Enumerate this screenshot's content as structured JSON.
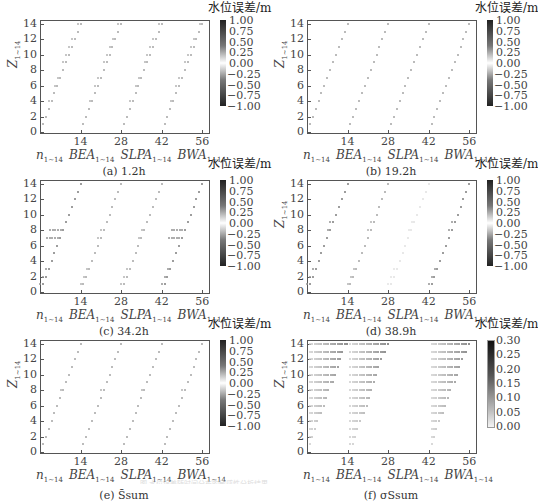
{
  "figure": {
    "colorbar_title": "水位误差/m",
    "ylabel_main": "Z",
    "ylabel_sub": "1~14",
    "xlabel_groups": [
      {
        "main": "n",
        "sub": "1~14"
      },
      {
        "main": "BEA",
        "sub": "1~14"
      },
      {
        "main": "SLPA",
        "sub": "1~14"
      },
      {
        "main": "BWA",
        "sub": "1~14"
      }
    ],
    "footer_text": "图 水位误差随时间分布的敏感性分析结果"
  },
  "panels": [
    {
      "id": "a",
      "caption": "(a) 1.2h",
      "show_ylabel": true
    },
    {
      "id": "b",
      "caption": "(b) 19.2h",
      "show_ylabel": true
    },
    {
      "id": "c",
      "caption": "(c) 34.2h",
      "show_ylabel": false
    },
    {
      "id": "d",
      "caption": "(d) 38.9h",
      "show_ylabel": true
    },
    {
      "id": "e",
      "caption": "(e) S̄sum",
      "show_ylabel": true
    },
    {
      "id": "f",
      "caption": "(f) σSsum",
      "show_ylabel": true
    }
  ],
  "chart_data": [
    {
      "type": "scatter",
      "title": "(a) 1.2h",
      "xlabel": "n1~14  BEA1~14  SLPA1~14  BWA1~14",
      "ylabel": "Z1~14",
      "xticks": [
        14,
        28,
        42,
        56
      ],
      "yticks": [
        0,
        2,
        4,
        6,
        8,
        10,
        12,
        14
      ],
      "xlim": [
        0,
        58
      ],
      "ylim": [
        0,
        14.5
      ],
      "colorbar": {
        "label": "水位误差/m",
        "ticks": [
          "1.00",
          "0.75",
          "0.50",
          "0.25",
          "0.00",
          "-0.25",
          "-0.50",
          "-0.75",
          "-1.00"
        ],
        "range": [
          -1.0,
          1.0
        ]
      },
      "description": "Diagonal bands of small markers for each parameter group; slight spreading at several levels in n, BEA and BWA groups; values near 0 with small mixed deviations",
      "spread_rows": [
        4,
        6,
        7,
        9,
        10,
        11,
        12,
        14
      ]
    },
    {
      "type": "scatter",
      "title": "(b) 19.2h",
      "xlabel": "n1~14  BEA1~14  SLPA1~14  BWA1~14",
      "ylabel": "Z1~14",
      "xticks": [
        14,
        28,
        42,
        56
      ],
      "yticks": [
        0,
        2,
        4,
        6,
        8,
        10,
        12,
        14
      ],
      "xlim": [
        0,
        58
      ],
      "ylim": [
        0,
        14.5
      ],
      "colorbar": {
        "label": "水位误差/m",
        "ticks": [
          "1.00",
          "0.75",
          "0.50",
          "0.25",
          "0.00",
          "-0.25",
          "-0.50",
          "-0.75",
          "-1.00"
        ],
        "range": [
          -1.0,
          1.0
        ]
      },
      "description": "Clean diagonal lines, single markers per row, errors near 0",
      "spread_rows": []
    },
    {
      "type": "scatter",
      "title": "(c) 34.2h",
      "xlabel": "n1~14  BEA1~14  SLPA1~14  BWA1~14",
      "ylabel": "",
      "xticks": [
        14,
        28,
        42,
        56
      ],
      "yticks": [
        0,
        2,
        4,
        6,
        8,
        10,
        12,
        14
      ],
      "xlim": [
        0,
        58
      ],
      "ylim": [
        0,
        14.5
      ],
      "colorbar": {
        "label": "水位误差/m",
        "ticks": [
          "1.00",
          "0.75",
          "0.50",
          "0.25",
          "0.00",
          "-0.25",
          "-0.50",
          "-0.75",
          "-1.00"
        ],
        "range": [
          -1.0,
          1.0
        ]
      },
      "description": "Strong horizontal spread at Z=7-8 in n group and BWA group; darker markers in lower BWA rows",
      "spread_rows": [
        1,
        2,
        3,
        7,
        8
      ]
    },
    {
      "type": "scatter",
      "title": "(d) 38.9h",
      "xlabel": "n1~14  BEA1~14  SLPA1~14  BWA1~14",
      "ylabel": "Z1~14",
      "xticks": [
        14,
        28,
        42,
        56
      ],
      "yticks": [
        0,
        2,
        4,
        6,
        8,
        10,
        12,
        14
      ],
      "xlim": [
        0,
        58
      ],
      "ylim": [
        0,
        14.5
      ],
      "colorbar": {
        "label": "水位误差/m",
        "ticks": [
          "1.00",
          "0.75",
          "0.50",
          "0.25",
          "0.00",
          "-0.25",
          "-0.50",
          "-0.75",
          "-1.00"
        ],
        "range": [
          -1.0,
          1.0
        ]
      },
      "description": "Darker markers in n and BWA groups; SLPA group very faint",
      "spread_rows": [
        1,
        2,
        3,
        8,
        9
      ]
    },
    {
      "type": "scatter",
      "title": "(e) S̄sum",
      "xlabel": "n1~14  BEA1~14  SLPA1~14  BWA1~14",
      "ylabel": "Z1~14",
      "xticks": [
        14,
        28,
        42,
        56
      ],
      "yticks": [
        0,
        2,
        4,
        6,
        8,
        10,
        12,
        14
      ],
      "xlim": [
        0,
        58
      ],
      "ylim": [
        0,
        14.5
      ],
      "colorbar": {
        "label": "水位误差/m",
        "ticks": [
          "1.00",
          "0.75",
          "0.50",
          "0.25",
          "0.00",
          "-0.25",
          "-0.50",
          "-0.75",
          "-1.00"
        ],
        "range": [
          -1.0,
          1.0
        ]
      },
      "description": "Mean error: clean diagonal lines with minor spread near Z=8",
      "spread_rows": [
        8
      ]
    },
    {
      "type": "scatter",
      "title": "(f) σSsum",
      "xlabel": "n1~14  BEA1~14  SLPA1~14  BWA1~14",
      "ylabel": "Z1~14",
      "xticks": [
        14,
        28,
        42,
        56
      ],
      "yticks": [
        0,
        2,
        4,
        6,
        8,
        10,
        12,
        14
      ],
      "xlim": [
        0,
        58
      ],
      "ylim": [
        0,
        14.5
      ],
      "colorbar": {
        "label": "水位误差/m",
        "ticks": [
          "0.30",
          "0.25",
          "0.20",
          "0.15",
          "0.10",
          "0.05",
          "0.00"
        ],
        "range": [
          0.0,
          0.3
        ]
      },
      "description": "Std. deviation: dotted horizontal rows spanning from group start to the diagonal; darker at right ends",
      "spread_rows": "all"
    }
  ]
}
